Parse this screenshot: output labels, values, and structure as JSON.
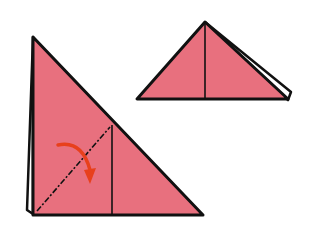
{
  "diagram": {
    "type": "origami-instruction",
    "colors": {
      "paper": "#e8707e",
      "outline": "#111111",
      "arrow": "#e8401c",
      "background": "#ffffff"
    },
    "steps": [
      {
        "name": "large-triangle-step",
        "description": "Right triangle folded with a vertical crease; valley-fold the bottom-left along dashed line",
        "fold_line": "dash-dot diagonal",
        "arrow": "curved fold arrow"
      },
      {
        "name": "small-triangle-result",
        "description": "Resulting small triangle with center vertical crease"
      }
    ]
  }
}
